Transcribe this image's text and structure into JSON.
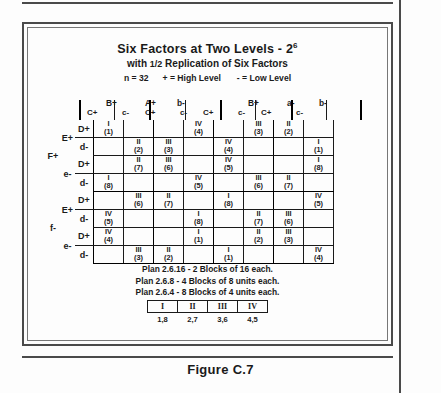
{
  "figure": {
    "caption": "Figure C.7"
  },
  "header": {
    "title_main": "Six Factors at Two Levels - 2",
    "title_exponent": "6",
    "subtitle_pre": "with ",
    "subtitle_frac": "1/2",
    "subtitle_post": " Replication of Six Factors",
    "legend_n": "n = 32",
    "legend_high": "+ = High Level",
    "legend_low": "- = Low Level"
  },
  "table": {
    "col_groups_top": [
      {
        "label": "A+",
        "left": 70
      },
      {
        "label": "a-",
        "left": 212
      }
    ],
    "col_groups_mid": [
      {
        "label": "B+",
        "left": 31
      },
      {
        "label": "b-",
        "left": 101
      },
      {
        "label": "B+",
        "left": 172
      },
      {
        "label": "b-",
        "left": 243
      }
    ],
    "col_headers": [
      "C+",
      "c-",
      "C+",
      "c-",
      "C+",
      "c-",
      "C+",
      "c-"
    ],
    "row_labels_outer": [
      "F+",
      "f-"
    ],
    "row_labels_mid": [
      "E+",
      "e-",
      "E+",
      "e-"
    ],
    "row_labels_inner": [
      "D+",
      "d-",
      "D+",
      "d-",
      "D+",
      "d-",
      "D+",
      "d-"
    ],
    "rows": [
      [
        {
          "rn": "I",
          "un": "(1)"
        },
        null,
        null,
        {
          "rn": "IV",
          "un": "(4)"
        },
        null,
        {
          "rn": "III",
          "un": "(3)"
        },
        {
          "rn": "II",
          "un": "(2)"
        },
        null
      ],
      [
        null,
        {
          "rn": "II",
          "un": "(2)"
        },
        {
          "rn": "III",
          "un": "(3)"
        },
        null,
        {
          "rn": "IV",
          "un": "(4)"
        },
        null,
        null,
        {
          "rn": "I",
          "un": "(1)"
        }
      ],
      [
        null,
        {
          "rn": "II",
          "un": "(7)"
        },
        {
          "rn": "III",
          "un": "(6)"
        },
        null,
        {
          "rn": "IV",
          "un": "(5)"
        },
        null,
        null,
        {
          "rn": "I",
          "un": "(8)"
        }
      ],
      [
        {
          "rn": "I",
          "un": "(8)"
        },
        null,
        null,
        {
          "rn": "IV",
          "un": "(5)"
        },
        null,
        {
          "rn": "III",
          "un": "(6)"
        },
        {
          "rn": "II",
          "un": "(7)"
        },
        null
      ],
      [
        null,
        {
          "rn": "III",
          "un": "(6)"
        },
        {
          "rn": "II",
          "un": "(7)"
        },
        null,
        {
          "rn": "I",
          "un": "(8)"
        },
        null,
        null,
        {
          "rn": "IV",
          "un": "(5)"
        }
      ],
      [
        {
          "rn": "IV",
          "un": "(5)"
        },
        null,
        null,
        {
          "rn": "I",
          "un": "(8)"
        },
        null,
        {
          "rn": "II",
          "un": "(7)"
        },
        {
          "rn": "III",
          "un": "(6)"
        },
        null
      ],
      [
        {
          "rn": "IV",
          "un": "(4)"
        },
        null,
        null,
        {
          "rn": "I",
          "un": "(1)"
        },
        null,
        {
          "rn": "II",
          "un": "(2)"
        },
        {
          "rn": "III",
          "un": "(3)"
        },
        null
      ],
      [
        null,
        {
          "rn": "III",
          "un": "(3)"
        },
        {
          "rn": "II",
          "un": "(2)"
        },
        null,
        {
          "rn": "I",
          "un": "(1)"
        },
        null,
        null,
        {
          "rn": "IV",
          "un": "(4)"
        }
      ]
    ]
  },
  "plans": [
    "Plan 2.6.16 - 2 Blocks of 16 each.",
    "Plan 2.6.8 - 4 Blocks of 8 units each.",
    "Plan 2.6.4 - 8 Blocks of 4 units each."
  ],
  "mini_table": {
    "headers": [
      "I",
      "II",
      "III",
      "IV"
    ],
    "values": [
      "1,8",
      "2,7",
      "3,6",
      "4,5"
    ]
  }
}
